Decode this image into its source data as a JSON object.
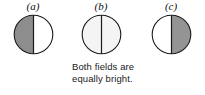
{
  "figure": {
    "background_color": "#ffffff",
    "outline_color": "#1a1a1a",
    "divider_color": "#1a1a1a",
    "panels": [
      {
        "label": "(a)",
        "left_half_color": "#8d8d8d",
        "right_half_color": "#ffffff",
        "left_half_name": "gray-field",
        "right_half_name": "white-field"
      },
      {
        "label": "(b)",
        "left_half_color": "#f4f4f4",
        "right_half_color": "#f4f4f4",
        "left_half_name": "light-field",
        "right_half_name": "light-field"
      },
      {
        "label": "(c)",
        "left_half_color": "#ffffff",
        "right_half_color": "#949494",
        "left_half_name": "white-field",
        "right_half_name": "gray-field"
      }
    ],
    "caption": {
      "line1": "Both fields are",
      "line2": "equally bright."
    }
  }
}
